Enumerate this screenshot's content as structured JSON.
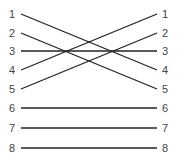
{
  "diagram": {
    "type": "crossover-pinout",
    "left_pins": [
      "1",
      "2",
      "3",
      "4",
      "5",
      "6",
      "7",
      "8"
    ],
    "right_pins": [
      "1",
      "2",
      "3",
      "4",
      "5",
      "6",
      "7",
      "8"
    ],
    "connections": [
      {
        "from": "1",
        "to": "4"
      },
      {
        "from": "2",
        "to": "5"
      },
      {
        "from": "3",
        "to": "3"
      },
      {
        "from": "4",
        "to": "1"
      },
      {
        "from": "5",
        "to": "2"
      },
      {
        "from": "6",
        "to": "6"
      },
      {
        "from": "7",
        "to": "7"
      },
      {
        "from": "8",
        "to": "8"
      }
    ],
    "line_color": "#222222",
    "label_color": "#444444"
  }
}
